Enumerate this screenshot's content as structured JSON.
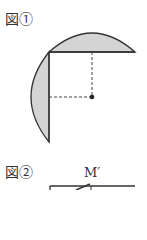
{
  "figure1": {
    "label": "図①",
    "colors": {
      "stroke": "#333333",
      "fill": "#d4d4d4",
      "background": "#ffffff"
    },
    "elements": {
      "horizontal_chord": {
        "x1": 49,
        "y1": 52,
        "x2": 135,
        "y2": 52
      },
      "vertical_chord": {
        "x1": 49,
        "y1": 52,
        "x2": 49,
        "y2": 142
      },
      "top_arc_peak": {
        "x": 92,
        "y": 33
      },
      "left_arc_extreme": {
        "x": 31,
        "y": 97
      },
      "center_dot": {
        "x": 92,
        "y": 97
      },
      "dashed_vertical": {
        "x1": 92,
        "y1": 52,
        "x2": 92,
        "y2": 97
      },
      "dashed_horizontal": {
        "x1": 49,
        "y1": 97,
        "x2": 92,
        "y2": 97
      }
    }
  },
  "figure2": {
    "label": "図②",
    "point_label": "M′",
    "colors": {
      "stroke": "#333333"
    }
  }
}
